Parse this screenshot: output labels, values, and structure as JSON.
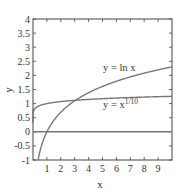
{
  "chart_data": {
    "type": "line",
    "title": "",
    "xlabel": "x",
    "ylabel": "y",
    "xlim": [
      0,
      10
    ],
    "ylim": [
      -1,
      4
    ],
    "grid": false,
    "x_ticks": [
      "1",
      "2",
      "3",
      "4",
      "5",
      "6",
      "7",
      "8",
      "9"
    ],
    "y_ticks": [
      "-1",
      "-0.5",
      "0",
      "0.5",
      "1",
      "1.5",
      "2",
      "2.5",
      "3",
      "3.5",
      "4"
    ],
    "series": [
      {
        "name": "y = ln x",
        "function": "ln(x)",
        "x": [
          0.37,
          0.5,
          1,
          2,
          3,
          4,
          5,
          6,
          7,
          8,
          9,
          10
        ],
        "y": [
          -1.0,
          -0.69,
          0,
          0.69,
          1.1,
          1.39,
          1.61,
          1.79,
          1.95,
          2.08,
          2.2,
          2.3
        ]
      },
      {
        "name": "y = x^(1/10)",
        "function": "x^0.1",
        "x": [
          0.0,
          0.05,
          0.2,
          0.5,
          1,
          2,
          3,
          4,
          5,
          6,
          7,
          8,
          9,
          10
        ],
        "y": [
          0.0,
          0.74,
          0.85,
          0.93,
          1.0,
          1.07,
          1.12,
          1.15,
          1.17,
          1.2,
          1.21,
          1.23,
          1.25,
          1.26
        ]
      },
      {
        "name": "y = 0",
        "function": "0",
        "x": [
          0,
          10
        ],
        "y": [
          0,
          0
        ]
      }
    ],
    "annotations": [
      {
        "text": "y = ln x",
        "x": 5.5,
        "y": 2.0
      },
      {
        "text": "y = x",
        "sup": "1/10",
        "x": 5.5,
        "y": 0.95
      }
    ]
  }
}
